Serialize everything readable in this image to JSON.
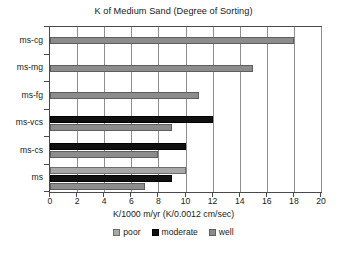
{
  "chart_data": {
    "type": "bar",
    "orientation": "horizontal",
    "title": "K of Medium Sand (Degree of Sorting)",
    "xlabel": "K/1000 m/yr (K/0.0012 cm/sec)",
    "ylabel": "",
    "categories": [
      "ms-cg",
      "ms-mg",
      "ms-fg",
      "ms-vcs",
      "ms-cs",
      "ms"
    ],
    "series": [
      {
        "name": "poor",
        "color": "#a8a8a8",
        "values": [
          null,
          null,
          null,
          null,
          null,
          10
        ]
      },
      {
        "name": "moderate",
        "color": "#101010",
        "values": [
          null,
          null,
          null,
          12,
          10,
          9
        ]
      },
      {
        "name": "well",
        "color": "#8c8c8c",
        "values": [
          18,
          15,
          11,
          9,
          8,
          7
        ]
      }
    ],
    "xlim": [
      0,
      20
    ],
    "xticks": [
      0,
      2,
      4,
      6,
      8,
      10,
      12,
      14,
      16,
      18,
      20
    ],
    "xtick_labels": [
      "0",
      "2",
      "4",
      "6",
      "8",
      "10",
      "12",
      "14",
      "16",
      "18",
      "20"
    ],
    "grid": "vertical",
    "legend_position": "bottom",
    "legend": [
      "poor",
      "moderate",
      "well"
    ]
  }
}
